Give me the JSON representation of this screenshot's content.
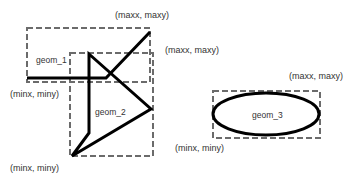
{
  "diagram": {
    "geometries": [
      {
        "id": "geom_1",
        "label": "geom_1",
        "type": "linestring",
        "bbox_labels": {
          "max": "(maxx, maxy)",
          "min": "(minx, miny)"
        }
      },
      {
        "id": "geom_2",
        "label": "geom_2",
        "type": "polygon",
        "bbox_labels": {
          "max": "(maxx, maxy)",
          "min": "(minx, miny)"
        }
      },
      {
        "id": "geom_3",
        "label": "geom_3",
        "type": "ellipse",
        "bbox_labels": {
          "max": "(maxx, maxy)",
          "min": "(minx, miny)"
        }
      }
    ],
    "colors": {
      "geometry_stroke": "#000000",
      "bbox_stroke": "#6b6b6b",
      "text": "#333333",
      "background": "#ffffff"
    }
  }
}
